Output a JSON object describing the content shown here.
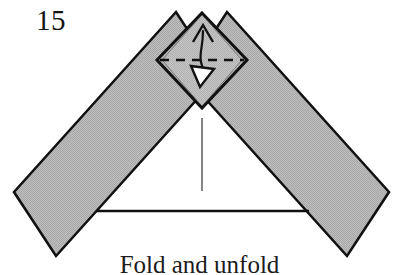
{
  "figure": {
    "step_number": "15",
    "caption": "Fold and unfold",
    "type": "origami-instruction-diagram",
    "colors": {
      "paper_fill": "#b4b4b4",
      "paper_fill_light": "#bfbfbf",
      "outline": "#111111",
      "background": "#ffffff",
      "crease_line": "#2a2a2a",
      "arrow": "#111111",
      "arrow_hollow_fill": "#ffffff"
    },
    "elements": {
      "left_band_name": "left-paper-band",
      "right_band_name": "right-paper-band",
      "diamond_name": "apex-diamond-flap",
      "dashed_name": "valley-fold-dashed-line",
      "solid_arrow_name": "fold-arrow-up",
      "hollow_arrow_name": "unfold-arrow-down",
      "baseline_name": "base-edge-line",
      "center_crease_name": "center-crease-line"
    },
    "geometry": {
      "apex": [
        202,
        13
      ],
      "diamond_top": [
        202,
        13
      ],
      "diamond_left": [
        157,
        60
      ],
      "diamond_right": [
        246,
        60
      ],
      "diamond_bottom": [
        202,
        108
      ],
      "dashed_line_y": 60,
      "dashed_line_x0": 160,
      "dashed_line_x1": 244,
      "center_crease_x": 202,
      "center_crease_y0": 118,
      "center_crease_y1": 191,
      "baseline_y": 211,
      "baseline_x0": 96,
      "baseline_x1": 309,
      "left_band_outer": [
        [
          176,
          13
        ],
        [
          14,
          192
        ],
        [
          55,
          255
        ],
        [
          216,
          76
        ]
      ],
      "right_band_outer": [
        [
          226,
          13
        ],
        [
          388,
          192
        ],
        [
          347,
          255
        ],
        [
          187,
          76
        ]
      ]
    }
  }
}
